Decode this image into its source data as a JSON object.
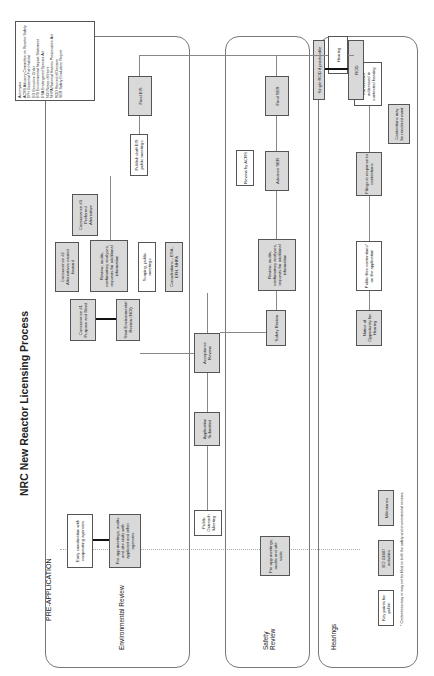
{
  "title": "NRC New Reactor Licensing Process",
  "phase_label": "PRE-APPLICATION",
  "lanes": {
    "environmental": "Environmental Review",
    "safety": "Safety Review",
    "hearings": "Hearings"
  },
  "boxes": {
    "early_coord": "Early coordination with cooperating agencies",
    "preapp_env": "Pre-app meetings, audits and site visits with applicant and other agencies",
    "public_outreach": "Public Outreach Meeting",
    "app_submitted": "Application Submitted",
    "acceptance": "Acceptance Review",
    "concurrence1": "Concurrence #1 Purpose and Need",
    "start_env": "Start Environmental Review (NOI)",
    "concurrence2": "Concurrence #2 Alternatives carried forward",
    "review_env": "Review, audits, confirmatory analyses, requests for additional information",
    "scoping": "Scoping, public meetings",
    "consultations": "Consultations – ESA, EFH, NHPA",
    "concurrence3": "Concurrence #3 Preferred Alternative",
    "draft_eis": "Publish draft EIS public meetings",
    "final_eis": "Final EIS",
    "preapp_safety": "Pre-app meetings, audits and site visits",
    "safety_review": "Safety Review",
    "review_safety": "Review, audits, confirmatory analyses, requests for additional information",
    "advance_ser": "Advance SER",
    "review_acrs": "Review by ACRS",
    "final_ser": "Final SER",
    "notice_hearing": "Notice of Opportunity for Hearing",
    "public_files": "Public files contentions* on the application",
    "filings": "Filings in response to contentions",
    "contentions_moot": "Contentions may be rendered moot",
    "contentions_addressed": "Contentions addressed in contested hearing",
    "hearing": "Hearing",
    "single_rod": "Single ROD if practicable",
    "rod": "ROD"
  },
  "legend_keys": {
    "key_points": "Key points for public",
    "eo_activities": "EO 13807 activities",
    "milestones": "Milestones"
  },
  "footnote": "* Contentions may or may not be filed on both the safety and environmental reviews.",
  "acronyms": {
    "heading": "Acronyms",
    "items": [
      "ACRS Advisory Committee on Reactor Safety",
      "EFH Essential Fish Habitat",
      "EO Executive Order",
      "EIS Environmental Impact Statement",
      "ESA Endangered Species Act",
      "NOI Notice of Intent",
      "NHPA National Historic Preservation Act",
      "ROD Record of Decision",
      "SER Safety Evaluation Report"
    ]
  }
}
